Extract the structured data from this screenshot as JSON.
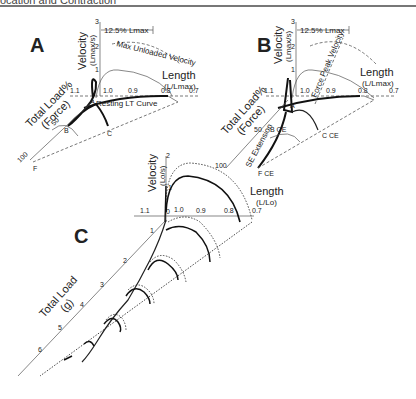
{
  "header": {
    "title": "ocation and Contraction"
  },
  "panels": {
    "A": {
      "letter": "A",
      "velocity_label": "Velocity",
      "velocity_unit": "(Lmax/s)",
      "length_label": "Length",
      "length_unit": "(L/Lmax)",
      "load_label": "Total Load%",
      "load_unit": "(Force)",
      "scale_bar": "12.5% Lmax",
      "curve_label_max": "Max Unloaded Velocity",
      "curve_label_rest": "Resting LT Curve",
      "velocity_ticks": [
        "1",
        "2",
        "3"
      ],
      "length_ticks": [
        "1.1",
        "1.0",
        "0.9",
        "0.8",
        "0.7"
      ],
      "load_ticks": [
        "50",
        "100"
      ],
      "points": [
        "A",
        "B",
        "C",
        "F"
      ]
    },
    "B": {
      "letter": "B",
      "velocity_label": "Velocity",
      "velocity_unit": "(Lmax/s)",
      "length_label": "Length",
      "length_unit": "(L/Lmax)",
      "load_label": "Total Load%",
      "load_unit": "(Force)",
      "scale_bar": "12.5% Lmax",
      "curve_label_peak": "Force Peak Velocity",
      "curve_label_se": "SE Extension",
      "velocity_ticks": [
        "1",
        "2",
        "3"
      ],
      "length_ticks": [
        "1.1",
        "1.0",
        "0.9",
        "0.8",
        "0.7"
      ],
      "load_ticks": [
        "50",
        "100"
      ],
      "points": [
        "A",
        "B CE",
        "C CE",
        "F CE"
      ]
    },
    "C": {
      "letter": "C",
      "velocity_label": "Velocity",
      "velocity_unit": "(Lo/s)",
      "length_label": "Length",
      "length_unit": "(L/Lo)",
      "load_label": "Total Load",
      "load_unit": "(g)",
      "velocity_ticks": [
        "1",
        "2"
      ],
      "length_ticks": [
        "1.1",
        "1.0",
        "0.9",
        "0.8",
        "0.7"
      ],
      "load_ticks": [
        "1",
        "2",
        "3",
        "4",
        "5",
        "6"
      ],
      "origin": "0"
    }
  }
}
